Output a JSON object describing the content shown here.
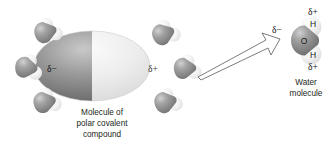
{
  "figure": {
    "background_color": "#ffffff",
    "text_color": "#231f20"
  },
  "central_molecule": {
    "name": "polar-covalent-molecule",
    "negative_pole_label": "δ−",
    "positive_pole_label": "δ+",
    "negative_half_color": "#6e6e6e",
    "positive_half_color": "#e3e3e3",
    "caption_lines": [
      "Molecule of",
      "polar covalent",
      "compound"
    ]
  },
  "surrounding_water_molecules": {
    "count": 6,
    "oxygen_color": "#8d8d8d",
    "hydrogen_color": "#e8e8e8",
    "items": [
      {
        "id": "water-top-left",
        "position": "upper left of molecule"
      },
      {
        "id": "water-mid-left",
        "position": "left of molecule, negative pole side"
      },
      {
        "id": "water-bottom-left",
        "position": "lower left of molecule"
      },
      {
        "id": "water-top-right",
        "position": "upper right of molecule"
      },
      {
        "id": "water-mid-right",
        "position": "right of molecule, positive pole side"
      },
      {
        "id": "water-bottom-right",
        "position": "lower right of molecule"
      }
    ]
  },
  "callout": {
    "name": "magnification-arrow",
    "style": "open outlined arrow",
    "direction": "points up and to the right",
    "stroke_color": "#4d4d4d",
    "fill_color": "#ffffff"
  },
  "water_molecule_detail": {
    "negative_label": "δ−",
    "oxygen_label": "O",
    "hydrogen_top_label": "H",
    "hydrogen_bottom_label": "H",
    "positive_label_top": "δ+",
    "positive_label_bottom": "δ+",
    "caption_lines": [
      "Water",
      "molecule"
    ],
    "oxygen_color": "#7e7e7e",
    "hydrogen_color": "#ededed"
  }
}
